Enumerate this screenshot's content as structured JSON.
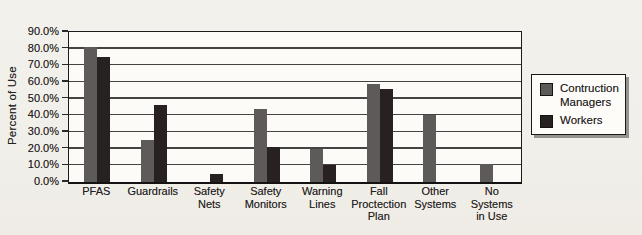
{
  "chart_data": {
    "type": "bar",
    "title": "",
    "ylabel": "Percent of Use",
    "xlabel": "",
    "ylim": [
      0,
      90
    ],
    "ytick_step": 10,
    "yticks": [
      "0.0%",
      "10.0%",
      "20.0%",
      "30.0%",
      "40.0%",
      "50.0%",
      "60.0%",
      "70.0%",
      "80.0%",
      "90.0%"
    ],
    "grid": true,
    "legend_position": "right",
    "categories": [
      "PFAS",
      "Guardrails",
      "Safety\nNets",
      "Safety\nMonitors",
      "Warning\nLines",
      "Fall\nProctection\nPlan",
      "Other\nSystems",
      "No\nSystems\nin Use"
    ],
    "series": [
      {
        "name": "Contruction Managers",
        "color": "#5e5a5a",
        "values": [
          81,
          25,
          0,
          44,
          20,
          59,
          40,
          11
        ]
      },
      {
        "name": "Workers",
        "color": "#272121",
        "values": [
          75,
          46,
          5,
          21,
          10,
          56,
          0,
          0
        ]
      }
    ]
  }
}
